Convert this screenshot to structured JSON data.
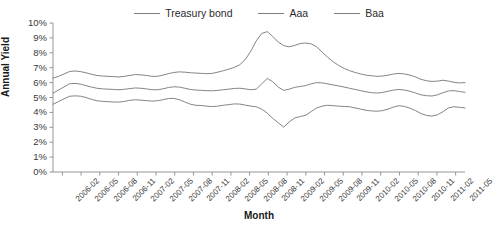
{
  "chart_data": {
    "type": "line",
    "title": "",
    "xlabel": "Month",
    "ylabel": "Annual Yield",
    "grid": false,
    "legend_position": "top",
    "ylim": [
      0,
      10
    ],
    "ytick_labels": [
      "10%",
      "9%",
      "8%",
      "7%",
      "6%",
      "5%",
      "4%",
      "3%",
      "2%",
      "1%",
      "0%"
    ],
    "ytick_values": [
      10,
      9,
      8,
      7,
      6,
      5,
      4,
      3,
      2,
      1,
      0
    ],
    "xtick_labels": [
      "2006-02",
      "2006-05",
      "2006-08",
      "2006-11",
      "2007-02",
      "2007-05",
      "2007-08",
      "2007-11",
      "2008-02",
      "2008-05",
      "2008-08",
      "2008-11",
      "2009-02",
      "2009-05",
      "2009-08",
      "2009-11",
      "2010-02",
      "2010-05",
      "2010-08",
      "2010-11",
      "2011-02",
      "2011-05"
    ],
    "series": [
      {
        "name": "Treasury bond",
        "color": "#7d7d7d",
        "values": [
          4.54,
          4.73,
          4.91,
          5.08,
          5.11,
          5.09,
          5.0,
          4.88,
          4.78,
          4.74,
          4.72,
          4.7,
          4.69,
          4.74,
          4.81,
          4.85,
          4.82,
          4.79,
          4.76,
          4.78,
          4.85,
          4.93,
          4.94,
          4.85,
          4.7,
          4.55,
          4.48,
          4.46,
          4.42,
          4.39,
          4.42,
          4.48,
          4.52,
          4.57,
          4.56,
          4.49,
          4.42,
          4.38,
          4.22,
          3.95,
          3.6,
          3.3,
          3.02,
          3.36,
          3.63,
          3.72,
          3.81,
          4.06,
          4.3,
          4.42,
          4.48,
          4.45,
          4.42,
          4.4,
          4.38,
          4.3,
          4.22,
          4.14,
          4.1,
          4.08,
          4.12,
          4.22,
          4.36,
          4.45,
          4.4,
          4.28,
          4.12,
          3.92,
          3.8,
          3.75,
          3.84,
          4.05,
          4.3,
          4.38,
          4.34,
          4.3
        ]
      },
      {
        "name": "Aaa",
        "color": "#7d7d7d",
        "values": [
          5.29,
          5.5,
          5.71,
          5.92,
          5.95,
          5.9,
          5.8,
          5.7,
          5.62,
          5.58,
          5.56,
          5.54,
          5.52,
          5.55,
          5.6,
          5.64,
          5.62,
          5.58,
          5.52,
          5.52,
          5.58,
          5.67,
          5.72,
          5.7,
          5.62,
          5.54,
          5.5,
          5.48,
          5.46,
          5.45,
          5.48,
          5.52,
          5.56,
          5.61,
          5.62,
          5.58,
          5.52,
          5.56,
          5.92,
          6.28,
          6.06,
          5.7,
          5.48,
          5.56,
          5.68,
          5.74,
          5.8,
          5.92,
          6.0,
          5.98,
          5.92,
          5.84,
          5.78,
          5.7,
          5.62,
          5.54,
          5.46,
          5.38,
          5.32,
          5.3,
          5.34,
          5.42,
          5.5,
          5.54,
          5.5,
          5.42,
          5.3,
          5.18,
          5.12,
          5.1,
          5.18,
          5.32,
          5.44,
          5.46,
          5.4,
          5.35
        ]
      },
      {
        "name": "Baa",
        "color": "#7d7d7d",
        "values": [
          6.3,
          6.42,
          6.58,
          6.74,
          6.78,
          6.74,
          6.66,
          6.56,
          6.48,
          6.44,
          6.42,
          6.4,
          6.38,
          6.42,
          6.48,
          6.54,
          6.52,
          6.48,
          6.42,
          6.42,
          6.5,
          6.6,
          6.68,
          6.72,
          6.7,
          6.66,
          6.64,
          6.62,
          6.6,
          6.62,
          6.7,
          6.8,
          6.9,
          7.02,
          7.2,
          7.55,
          8.1,
          8.8,
          9.3,
          9.42,
          9.1,
          8.72,
          8.48,
          8.4,
          8.5,
          8.62,
          8.66,
          8.6,
          8.4,
          8.05,
          7.7,
          7.4,
          7.15,
          6.95,
          6.8,
          6.68,
          6.58,
          6.5,
          6.46,
          6.42,
          6.44,
          6.5,
          6.58,
          6.62,
          6.58,
          6.5,
          6.38,
          6.22,
          6.12,
          6.08,
          6.1,
          6.16,
          6.1,
          6.02,
          5.98,
          6.0
        ]
      }
    ]
  }
}
